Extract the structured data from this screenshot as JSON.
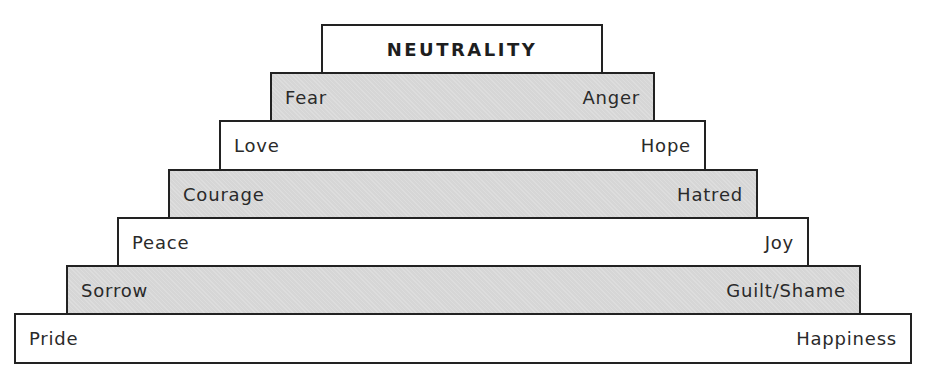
{
  "diagram": {
    "title": "NEUTRALITY",
    "tiers": [
      {
        "left": "Fear",
        "right": "Anger",
        "fill": "grey"
      },
      {
        "left": "Love",
        "right": "Hope",
        "fill": "white"
      },
      {
        "left": "Courage",
        "right": "Hatred",
        "fill": "grey"
      },
      {
        "left": "Peace",
        "right": "Joy",
        "fill": "white"
      },
      {
        "left": "Sorrow",
        "right": "Guilt/Shame",
        "fill": "grey"
      },
      {
        "left": "Pride",
        "right": "Happiness",
        "fill": "white"
      }
    ],
    "colors": {
      "grey_fill": "#d6d6d6",
      "white_fill": "#ffffff",
      "border": "#222222"
    }
  }
}
